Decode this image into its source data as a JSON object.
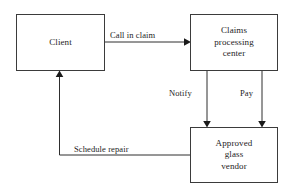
{
  "diagram": {
    "type": "flowchart",
    "background_color": "#ffffff",
    "line_color": "#2e2e2e",
    "text_color": "#1c1c1c",
    "nodes": [
      {
        "id": "client",
        "label": "Client"
      },
      {
        "id": "claims",
        "label": "Claims\nprocessing\ncenter"
      },
      {
        "id": "vendor",
        "label": "Approved\nglass\nvendor"
      }
    ],
    "edges": [
      {
        "id": "call-in-claim",
        "label": "Call in claim",
        "from": "client",
        "to": "claims"
      },
      {
        "id": "notify",
        "label": "Notify",
        "from": "claims",
        "to": "vendor"
      },
      {
        "id": "pay",
        "label": "Pay",
        "from": "claims",
        "to": "vendor"
      },
      {
        "id": "schedule-repair",
        "label": "Schedule repair",
        "from": "vendor",
        "to": "client"
      }
    ]
  }
}
